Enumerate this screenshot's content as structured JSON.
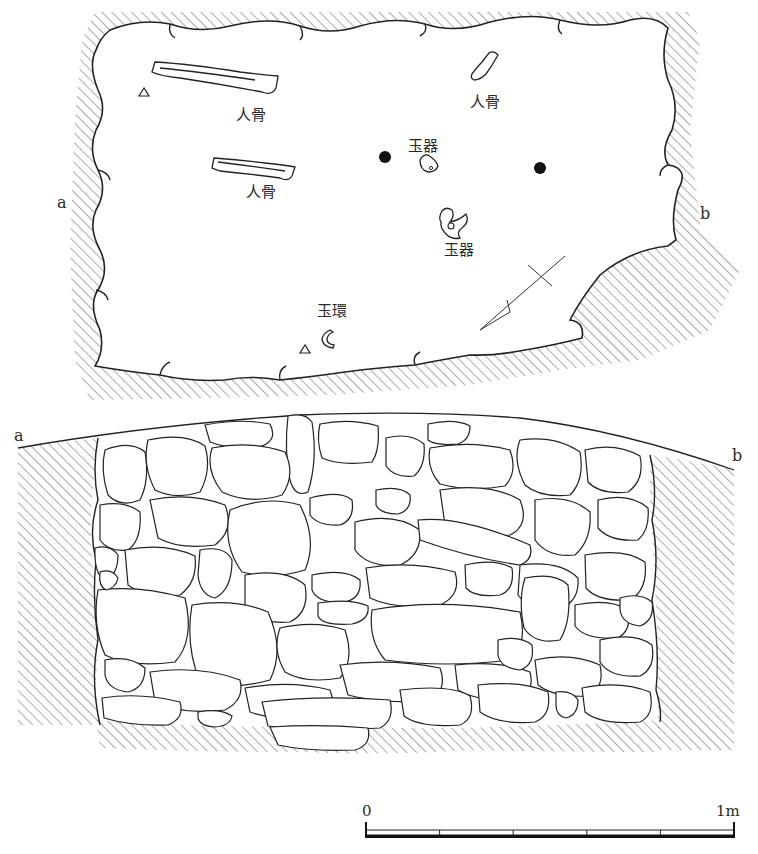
{
  "figure": {
    "plan_view": {
      "section_labels": {
        "left": "a",
        "right": "b"
      },
      "finds": [
        {
          "id": "bone1",
          "label": "人骨",
          "meaning": "human bone"
        },
        {
          "id": "bone2",
          "label": "人骨",
          "meaning": "human bone"
        },
        {
          "id": "bone3",
          "label": "人骨",
          "meaning": "human bone"
        },
        {
          "id": "jade1",
          "label": "玉器",
          "meaning": "jade artifact"
        },
        {
          "id": "jade2",
          "label": "玉器",
          "meaning": "jade artifact"
        },
        {
          "id": "ring",
          "label": "玉環",
          "meaning": "jade ring"
        }
      ],
      "markers": {
        "post_holes": 2,
        "triangles": 2,
        "north_arrow": true
      }
    },
    "section_view": {
      "section_labels": {
        "left": "a",
        "right": "b"
      },
      "fill": "stone packing"
    },
    "scale_bar": {
      "start_label": "0",
      "end_label": "1m",
      "divisions": 5
    },
    "colors": {
      "line": "#222222",
      "hatch": "#555555",
      "background": "#ffffff"
    }
  }
}
